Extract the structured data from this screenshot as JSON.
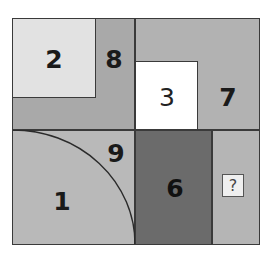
{
  "puzzle": {
    "regions": [
      {
        "id": "r2",
        "label": "2",
        "color": "#e2e2e2"
      },
      {
        "id": "r8",
        "label": "8",
        "color": "#a9a9a9"
      },
      {
        "id": "r3",
        "label": "3",
        "color": "#ffffff"
      },
      {
        "id": "r7",
        "label": "7",
        "color": "#b2b2b2"
      },
      {
        "id": "r9",
        "label": "9",
        "color": "#b9b9b9"
      },
      {
        "id": "r1",
        "label": "1",
        "color": "#b9b9b9"
      },
      {
        "id": "r6",
        "label": "6",
        "color": "#6b6b6b"
      },
      {
        "id": "rq",
        "label": "?",
        "color": "#b5b5b5"
      }
    ],
    "labels": {
      "two": "2",
      "eight": "8",
      "three": "3",
      "seven": "7",
      "nine": "9",
      "one": "1",
      "six": "6",
      "question": "?"
    }
  }
}
